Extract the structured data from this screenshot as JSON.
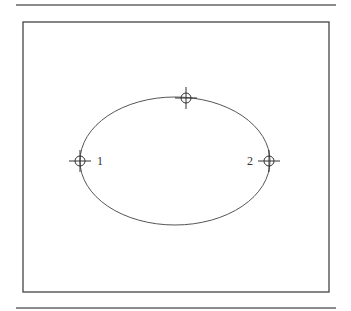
{
  "diagram": {
    "type": "ellipse-with-markers",
    "colors": {
      "line": "#555555",
      "frame": "#444444",
      "rule": "#666666",
      "background": "#ffffff"
    },
    "top_rule": {
      "x1": 16,
      "x2": 336,
      "y": 5
    },
    "bottom_rule": {
      "x1": 16,
      "x2": 336,
      "y": 308
    },
    "frame": {
      "x": 23,
      "y": 22,
      "width": 306,
      "height": 270
    },
    "ellipse": {
      "cx": 175,
      "cy": 161,
      "rx": 95,
      "ry": 64
    },
    "markers": [
      {
        "id": "marker-1",
        "x": 80,
        "y": 161,
        "label": "1",
        "label_x": 97,
        "label_y": 165
      },
      {
        "id": "marker-2",
        "x": 269,
        "y": 161,
        "label": "2",
        "label_x": 247,
        "label_y": 165
      },
      {
        "id": "marker-top",
        "x": 186,
        "y": 98,
        "label": ""
      }
    ]
  }
}
